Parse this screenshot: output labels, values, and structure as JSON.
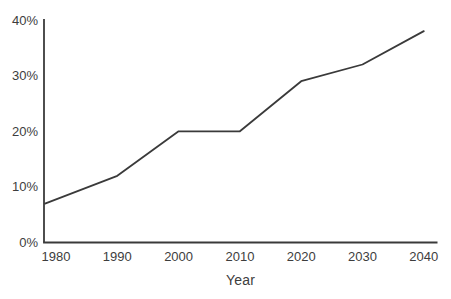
{
  "chart_data": {
    "type": "line",
    "title": "",
    "xlabel": "Year",
    "ylabel": "",
    "categories": [
      "1980",
      "1990",
      "2000",
      "2010",
      "2020",
      "2030",
      "2040"
    ],
    "series": [
      {
        "name": "percentage",
        "values": [
          7,
          12,
          20,
          20,
          29,
          32,
          38
        ]
      }
    ],
    "y_ticks": [
      0,
      10,
      20,
      30,
      40
    ],
    "y_tick_labels": [
      "0%",
      "10%",
      "20%",
      "30%",
      "40%"
    ],
    "ylim": [
      0,
      42
    ],
    "xlim_years": [
      1980,
      2040
    ],
    "grid": false,
    "legend": "none",
    "line_starts_at_y_axis": true,
    "marker": "none"
  },
  "colors": {
    "background": "#ffffff",
    "line": "#3a3a3a",
    "axis": "#3a3a3a",
    "text": "#3d3d3d"
  }
}
